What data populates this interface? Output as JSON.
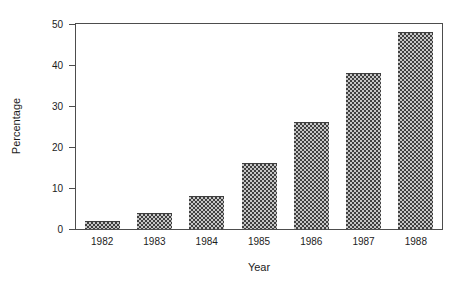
{
  "figure": {
    "background": "#ffffff"
  },
  "chart_data": {
    "type": "bar",
    "title": "",
    "categories": [
      "1982",
      "1983",
      "1984",
      "1985",
      "1986",
      "1987",
      "1988"
    ],
    "values": [
      2,
      4,
      8,
      16,
      26,
      38,
      48
    ],
    "xlabel": "Year",
    "ylabel": "Percentage",
    "ylim": [
      0,
      50
    ],
    "yticks": [
      0,
      10,
      20,
      30,
      40,
      50
    ],
    "grid": false,
    "legend": null,
    "frame": true,
    "bar_style": "halftone-gray-checker",
    "colors": {
      "axis": "#4d4d4d",
      "text": "#1c1c1c",
      "bar_dark": "#3f3f3f",
      "bar_light": "#c6c6c6",
      "background": "#ffffff"
    }
  }
}
